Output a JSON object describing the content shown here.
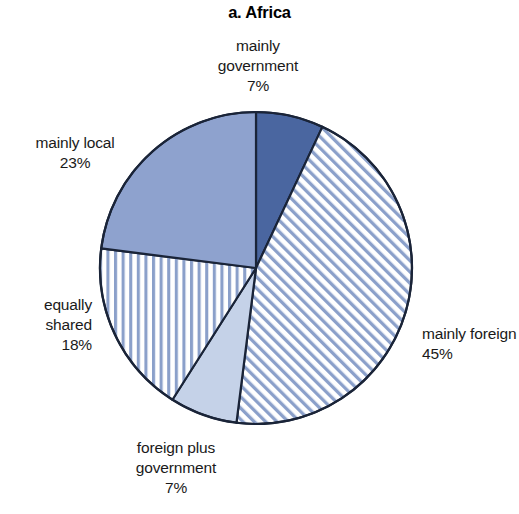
{
  "figure": {
    "title": "a. Africa",
    "background": "#ffffff"
  },
  "chart_data": {
    "type": "pie",
    "title": "a. Africa",
    "xlabel": "",
    "ylabel": "",
    "categories": [
      "mainly government",
      "mainly foreign",
      "foreign plus government",
      "equally shared",
      "mainly local"
    ],
    "values": [
      7,
      45,
      7,
      18,
      23
    ],
    "value_labels": [
      "7%",
      "45%",
      "7%",
      "18%",
      "23%"
    ],
    "units": "percent",
    "start_angle_deg": 0,
    "direction": "clockwise",
    "legend": "none",
    "grid": false,
    "slices": [
      {
        "name": "mainly government",
        "label_lines": [
          "mainly",
          "government",
          "7%"
        ],
        "value": 7,
        "value_label": "7%",
        "fill": "#4a66a0",
        "pattern": "solid",
        "stroke": "#1a2438"
      },
      {
        "name": "mainly foreign",
        "label_lines": [
          "mainly foreign",
          "45%"
        ],
        "value": 45,
        "value_label": "45%",
        "fill": "#ffffff",
        "pattern": "diagonal-stripes",
        "pattern_color": "#8ba0ca",
        "stroke": "#1a2438"
      },
      {
        "name": "foreign plus government",
        "label_lines": [
          "foreign plus",
          "government",
          "7%"
        ],
        "value": 7,
        "value_label": "7%",
        "fill": "#c5d2e8",
        "pattern": "solid",
        "stroke": "#1a2438"
      },
      {
        "name": "equally shared",
        "label_lines": [
          "equally",
          "shared",
          "18%"
        ],
        "value": 18,
        "value_label": "18%",
        "fill": "#ffffff",
        "pattern": "vertical-stripes",
        "pattern_color": "#8ba0ca",
        "stroke": "#1a2438"
      },
      {
        "name": "mainly local",
        "label_lines": [
          "mainly local",
          "23%"
        ],
        "value": 23,
        "value_label": "23%",
        "fill": "#8ea2ce",
        "pattern": "solid",
        "stroke": "#1a2438"
      }
    ],
    "geometry": {
      "center_x": 256,
      "center_y": 268,
      "radius": 156
    }
  },
  "labels": {
    "mainly_government": "mainly\ngovernment\n7%",
    "mainly_local": "mainly local\n23%",
    "equally_shared": "equally\nshared\n18%",
    "foreign_plus_government": "foreign plus\ngovernment\n7%",
    "mainly_foreign": "mainly foreign\n45%"
  }
}
